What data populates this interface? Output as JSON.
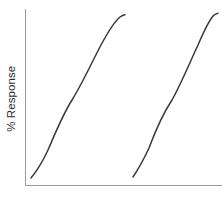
{
  "figure": {
    "width": 222,
    "height": 198,
    "background_color": "#ffffff"
  },
  "chart_data": {
    "type": "line",
    "title": "",
    "subtitle": "",
    "xlabel": "",
    "ylabel": "% Response",
    "grid": false,
    "legend": false,
    "legend_position": "none",
    "x_tick_labels": [],
    "y_tick_labels": [],
    "xlim": [
      0,
      100
    ],
    "ylim": [
      0,
      100
    ],
    "axis_color": "#9a9a9a",
    "curve_color": "#3a3a3a",
    "curve_width": 1.5,
    "series": [
      {
        "name": "Curve 1",
        "shape": "sigmoid",
        "ec50_x": 33,
        "bottom_y": 4,
        "top_y": 97,
        "hill_slope": 1.0,
        "path": "M 31 178 C 36 172, 42 163, 48 150 C 55 134, 62 116, 72 100 C 82 84, 92 62, 101 45 C 108 32, 114 22, 120 17 C 122 15.5, 123 15, 125 14.7",
        "points": [
          {
            "x": 31,
            "y": 178
          },
          {
            "x": 48,
            "y": 150
          },
          {
            "x": 72,
            "y": 100
          },
          {
            "x": 101,
            "y": 45
          },
          {
            "x": 123,
            "y": 15
          }
        ]
      },
      {
        "name": "Curve 2",
        "shape": "sigmoid",
        "ec50_x": 75,
        "bottom_y": 4,
        "top_y": 98,
        "hill_slope": 1.0,
        "path": "M 133 177 C 137 171, 143 161, 149 148 C 155 132, 162 115, 172 100 C 181 84, 190 62, 198 45 C 204 31, 209 21, 213 16 C 215 14, 216 13.4, 218 13.2",
        "points": [
          {
            "x": 133,
            "y": 177
          },
          {
            "x": 149,
            "y": 148
          },
          {
            "x": 172,
            "y": 100
          },
          {
            "x": 198,
            "y": 45
          },
          {
            "x": 213,
            "y": 14
          }
        ]
      }
    ],
    "axes": {
      "y_axis": {
        "x": 25,
        "y_top": 9,
        "y_bottom": 185
      },
      "x_axis": {
        "y": 185,
        "x_left": 25,
        "x_right": 222
      }
    }
  }
}
